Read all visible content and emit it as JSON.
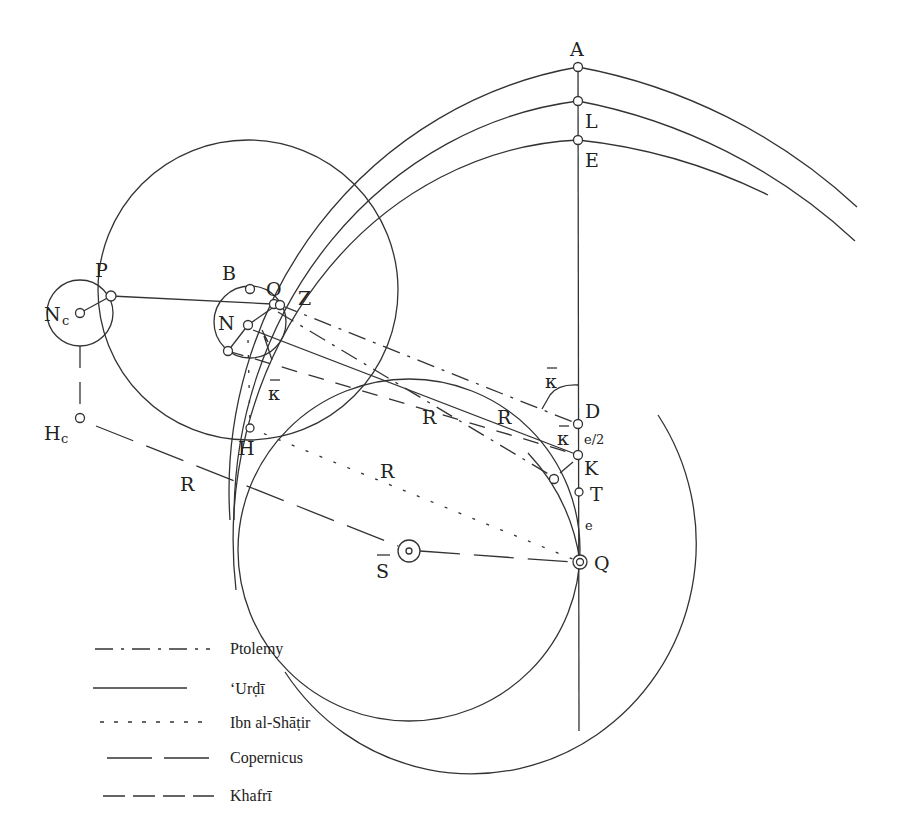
{
  "figure": {
    "points": {
      "A": "A",
      "L": "L",
      "E": "E",
      "P": "P",
      "B": "B",
      "O": "O",
      "Z": "Z",
      "N": "N",
      "Nc_main": "N",
      "Nc_sub": "c",
      "Hc_main": "H",
      "Hc_sub": "c",
      "H": "H",
      "D": "D",
      "K": "K",
      "T": "T",
      "Q": "Q",
      "S_bar": "S",
      "kappa": "κ"
    },
    "distances": {
      "R": "R",
      "e_half": "e/2",
      "e": "e"
    }
  },
  "legend": {
    "items": [
      {
        "label": "Ptolemy",
        "style": "dash-dot"
      },
      {
        "label": "‘Urḍī",
        "style": "solid"
      },
      {
        "label": "Ibn al-Shāṭir",
        "style": "dotted"
      },
      {
        "label": "Copernicus",
        "style": "long-dash"
      },
      {
        "label": "Khafrī",
        "style": "dashed"
      }
    ]
  },
  "colors": {
    "ink": "#333333",
    "background": "#ffffff"
  }
}
